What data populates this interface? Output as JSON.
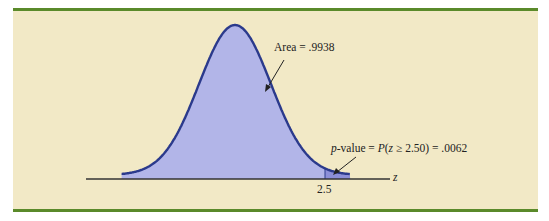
{
  "chart_data": {
    "type": "area",
    "title": "",
    "distribution": "standard normal",
    "xlabel": "z",
    "ylabel": "",
    "x_ticks": [
      {
        "value": 2.5,
        "label": "2.5"
      }
    ],
    "shaded_regions": [
      {
        "name": "Area",
        "from": "-inf",
        "to": 2.5,
        "value": 0.9938,
        "label": "Area = .9938"
      },
      {
        "name": "p-value",
        "from": 2.5,
        "to": "inf",
        "value": 0.0062,
        "label": "p-value = P(z ≥ 2.50) = .0062"
      }
    ],
    "grid": false,
    "legend": "none"
  },
  "labels": {
    "area": "Area = .9938",
    "pvalue_prefix": "p",
    "pvalue_rest": "-value = ",
    "pvalue_P": "P",
    "pvalue_open": "(",
    "pvalue_z": "z",
    "pvalue_cond": " ≥ 2.50) = .0062",
    "tick": "2.5",
    "axis": "z"
  },
  "colors": {
    "panel_bg": "#f2e9c6",
    "frame_green": "#5a8a2a",
    "fill_main": "#b2b5e8",
    "fill_tail": "#8c8fd8",
    "curve": "#2b3a8c",
    "axis": "#333333"
  }
}
